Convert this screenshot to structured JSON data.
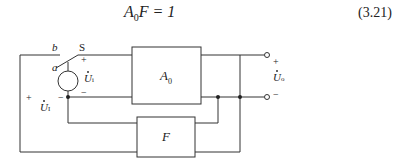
{
  "equation": {
    "lhs_main": "A",
    "lhs_sub": "0",
    "lhs_rest": "F = 1",
    "number": "(3.21)"
  },
  "diagram": {
    "switch_label": "S",
    "switch_pos_a": "a",
    "switch_pos_b": "b",
    "source_voltage": {
      "symbol": "U",
      "sub": "i"
    },
    "input_voltage": {
      "symbol": "U",
      "sub": "I"
    },
    "output_voltage": {
      "symbol": "U",
      "sub": "o"
    },
    "amplifier_block": {
      "symbol": "A",
      "sub": "0"
    },
    "feedback_block": {
      "symbol": "F"
    },
    "signs": {
      "plus": "+",
      "minus": "−"
    }
  },
  "colors": {
    "line": "#333333",
    "background": "#ffffff"
  }
}
